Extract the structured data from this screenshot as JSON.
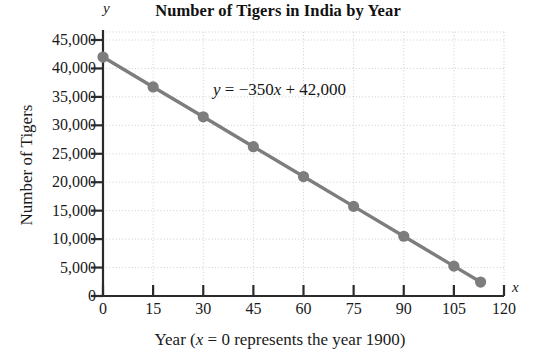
{
  "chart_data": {
    "type": "line",
    "title": "Number of Tigers in India by Year",
    "xlabel": "Year (x = 0 represents the year 1900)",
    "ylabel": "Number of Tigers",
    "xlim": [
      0,
      120
    ],
    "ylim": [
      0,
      45000
    ],
    "grid": true,
    "legend": null,
    "x_axis_letter": "y",
    "y_axis_letter": "x",
    "xticks": [
      0,
      15,
      30,
      45,
      60,
      75,
      90,
      105,
      120
    ],
    "xtick_labels": [
      "0",
      "15",
      "30",
      "45",
      "60",
      "75",
      "90",
      "105",
      "120"
    ],
    "yticks": [
      0,
      5000,
      10000,
      15000,
      20000,
      25000,
      30000,
      35000,
      40000,
      45000
    ],
    "ytick_labels": [
      "0",
      "5,000",
      "10,000",
      "15,000",
      "20,000",
      "25,000",
      "30,000",
      "35,000",
      "40,000",
      "45,000"
    ],
    "annotation": "y = −350x + 42,000",
    "equation_slope": -350,
    "equation_intercept": 42000,
    "series": [
      {
        "name": "Number of Tigers",
        "color": "#7d7d7d",
        "marker": "circle",
        "x": [
          0,
          15,
          30,
          45,
          60,
          75,
          90,
          105,
          113
        ],
        "values": [
          42000,
          36750,
          31500,
          26250,
          21000,
          15750,
          10500,
          5250,
          2450
        ]
      }
    ]
  },
  "labels": {
    "title": "Number of Tigers in India by Year",
    "y_axis_title": "Number of Tigers",
    "x_axis_title_prefix": "Year (",
    "x_axis_title_var": "x",
    "x_axis_title_suffix": " = 0 represents the year 1900)",
    "axis_letter_y": "y",
    "axis_letter_x": "x",
    "equation_lhs": "y",
    "equation_rhs_a": " = −350",
    "equation_rhs_var": "x",
    "equation_rhs_b": " + 42,000"
  },
  "colors": {
    "series": "#7d7d7d",
    "axis": "#2b2b2b",
    "grid": "#c9c9c9",
    "text": "#1a1a1a"
  }
}
